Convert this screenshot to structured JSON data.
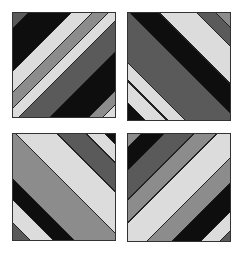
{
  "colors": {
    "black": "#0e0e0e",
    "dark": "#5a5a5a",
    "mid": "#8c8c8c",
    "light": "#dcdcdc",
    "seam": "#222222"
  },
  "tiles": [
    {
      "id": "tile-tl",
      "direction": "135deg",
      "bands": [
        [
          "dark",
          0,
          7
        ],
        [
          "black",
          7,
          28
        ],
        [
          "light",
          28,
          38
        ],
        [
          "mid",
          38,
          46
        ],
        [
          "light",
          46,
          53
        ],
        [
          "dark",
          53,
          68
        ],
        [
          "black",
          68,
          87
        ],
        [
          "mid",
          87,
          94
        ],
        [
          "light",
          94,
          100
        ]
      ]
    },
    {
      "id": "tile-tr",
      "direction": "45deg",
      "bands": [
        [
          "black",
          0,
          8
        ],
        [
          "light",
          8,
          18
        ],
        [
          "seam",
          18,
          19
        ],
        [
          "light",
          19,
          27
        ],
        [
          "dark",
          27,
          52
        ],
        [
          "black",
          52,
          66
        ],
        [
          "light",
          66,
          84
        ],
        [
          "dark",
          84,
          93
        ],
        [
          "mid",
          93,
          100
        ]
      ]
    },
    {
      "id": "tile-bl",
      "direction": "45deg",
      "bands": [
        [
          "dark",
          0,
          8
        ],
        [
          "light",
          8,
          19
        ],
        [
          "black",
          19,
          29
        ],
        [
          "mid",
          29,
          52
        ],
        [
          "light",
          52,
          72
        ],
        [
          "dark",
          72,
          86
        ],
        [
          "light",
          86,
          95
        ],
        [
          "black",
          95,
          100
        ]
      ]
    },
    {
      "id": "tile-br",
      "direction": "135deg",
      "bands": [
        [
          "mid",
          0,
          6
        ],
        [
          "black",
          6,
          17
        ],
        [
          "dark",
          17,
          31
        ],
        [
          "mid",
          31,
          42
        ],
        [
          "light",
          42,
          60
        ],
        [
          "mid",
          60,
          72
        ],
        [
          "black",
          72,
          86
        ],
        [
          "light",
          86,
          95
        ],
        [
          "dark",
          95,
          100
        ]
      ]
    }
  ]
}
